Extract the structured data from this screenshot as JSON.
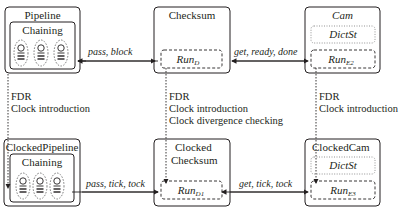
{
  "diagram": {
    "top_row": {
      "pipeline": {
        "title": "Pipeline",
        "inner": "Chaining",
        "worker_count": 3
      },
      "checksum": {
        "title": "Checksum",
        "process": "Run",
        "process_sub": "D"
      },
      "cam": {
        "title": "Cam",
        "state": "DictSt",
        "process": "Run",
        "process_sub": "E2"
      }
    },
    "bottom_row": {
      "pipeline": {
        "title": "ClockedPipeline",
        "inner": "Chaining",
        "worker_count": 3
      },
      "checksum": {
        "title_line1": "Clocked",
        "title_line2": "Checksum",
        "process": "Run",
        "process_sub": "D1"
      },
      "cam": {
        "title": "ClockedCam",
        "state": "DictSt",
        "process": "Run",
        "process_sub": "E3"
      }
    },
    "edges_top": {
      "pipeline_checksum": "pass, block",
      "checksum_cam": "get, ready, done"
    },
    "edges_bottom": {
      "pipeline_checksum": "pass, tick, tock",
      "checksum_cam": "get, tick, tock"
    },
    "transforms": {
      "pipeline": [
        "FDR",
        "Clock introduction"
      ],
      "checksum": [
        "FDR",
        "Clock introduction",
        "Clock divergence checking"
      ],
      "cam": [
        "FDR",
        "Clock introduction"
      ]
    }
  }
}
